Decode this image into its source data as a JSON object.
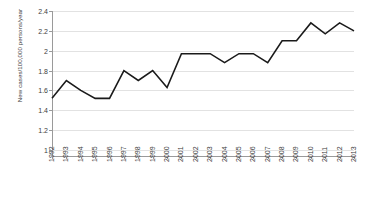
{
  "chart_data": {
    "type": "line",
    "title": "",
    "xlabel": "",
    "ylabel": "New cases/100,000 persons/year",
    "categories": [
      "1992",
      "1993",
      "1994",
      "1995",
      "1996",
      "1997",
      "1998",
      "1999",
      "2000",
      "2001",
      "2002",
      "2003",
      "2004",
      "2005",
      "2006",
      "2007",
      "2008",
      "2009",
      "2010",
      "2011",
      "2012",
      "2013"
    ],
    "values": [
      1.52,
      1.7,
      1.6,
      1.52,
      1.52,
      1.8,
      1.7,
      1.8,
      1.63,
      1.97,
      1.97,
      1.97,
      1.88,
      1.97,
      1.97,
      1.88,
      2.1,
      2.1,
      2.28,
      2.17,
      2.28,
      2.2
    ],
    "series": [
      {
        "name": "New cases per 100,000 persons per year",
        "values": [
          1.52,
          1.7,
          1.6,
          1.52,
          1.52,
          1.8,
          1.7,
          1.8,
          1.63,
          1.97,
          1.97,
          1.97,
          1.88,
          1.97,
          1.97,
          1.88,
          2.1,
          2.1,
          2.28,
          2.17,
          2.28,
          2.2
        ]
      }
    ],
    "ylim": [
      1,
      2.4
    ],
    "ytick_values": [
      1,
      1.2,
      1.4,
      1.6,
      1.8,
      2,
      2.2,
      2.4
    ],
    "ytick_labels": [
      "1",
      "1.2",
      "1.4",
      "1.6",
      "1.8",
      "2",
      "2.2",
      "2.4"
    ],
    "grid": true,
    "grid_axis": "y",
    "legend": false,
    "legend_position": "none",
    "line_color": "#1a1a1a",
    "line_width": 1.6,
    "markers": false,
    "grid_color": "#e2e2e2",
    "axis_color": "#9a9a9a",
    "background": "#ffffff"
  }
}
